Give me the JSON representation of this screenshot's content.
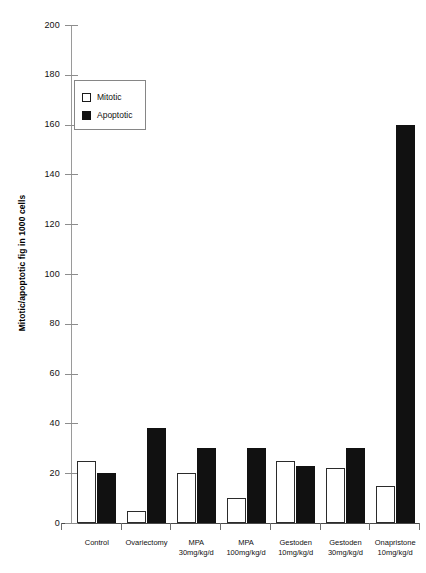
{
  "chart_data": {
    "type": "bar",
    "title": "",
    "xlabel": "",
    "ylabel": "Mitotic/apoptotic fig in 1000 cells",
    "ylim": [
      0,
      200
    ],
    "ytick_values": [
      0,
      20,
      40,
      60,
      80,
      100,
      120,
      140,
      160,
      180,
      200
    ],
    "ytick_labels": [
      "0",
      "20",
      "40",
      "60",
      "80",
      "100",
      "120",
      "140",
      "160",
      "180",
      "200"
    ],
    "grid": false,
    "legend_position": "upper-left-inside",
    "categories": [
      "Control",
      "Ovariectomy",
      "MPA 30mg/kg/d",
      "MPA 100mg/kg/d",
      "Gestoden 10mg/kg/d",
      "Gestoden 30mg/kg/d",
      "Onapristone 10mg/kg/d"
    ],
    "category_lines": [
      {
        "line1": "Control",
        "line2": ""
      },
      {
        "line1": "Ovariectomy",
        "line2": ""
      },
      {
        "line1": "MPA",
        "line2": "30mg/kg/d"
      },
      {
        "line1": "MPA",
        "line2": "100mg/kg/d"
      },
      {
        "line1": "Gestoden",
        "line2": "10mg/kg/d"
      },
      {
        "line1": "Gestoden",
        "line2": "30mg/kg/d"
      },
      {
        "line1": "Onapristone",
        "line2": "10mg/kg/d"
      }
    ],
    "series": [
      {
        "name": "Mitotic",
        "color": "#ffffff",
        "values": [
          25,
          5,
          20,
          10,
          25,
          22,
          15
        ]
      },
      {
        "name": "Apoptotic",
        "color": "#111111",
        "values": [
          20,
          38,
          30,
          30,
          23,
          30,
          160
        ]
      }
    ]
  },
  "legend": {
    "items": [
      {
        "label": "Mitotic",
        "swatch": "open-square-swatch"
      },
      {
        "label": "Apoptotic",
        "swatch": "filled-square-swatch"
      }
    ]
  },
  "colors": {
    "mitotic_fill": "#ffffff",
    "apoptotic_fill": "#111111",
    "outline": "#2b2b2b",
    "axis": "#8d8d8d",
    "background": "#ffffff"
  }
}
